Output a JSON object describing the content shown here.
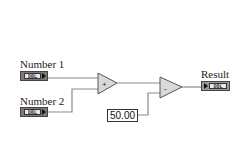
{
  "diagram": {
    "controls": [
      {
        "label": "Number 1",
        "type": "DBL"
      },
      {
        "label": "Number 2",
        "type": "DBL"
      }
    ],
    "functions": [
      {
        "name": "add",
        "symbol": "+"
      },
      {
        "name": "subtract",
        "symbol": "-"
      }
    ],
    "constant": {
      "value": "50.00"
    },
    "indicator": {
      "label": "Result",
      "type": "DBL"
    },
    "colors": {
      "wire": "#8a8a8a",
      "node_fill": "#d9d9d9",
      "terminal": "#7a7a7a"
    }
  }
}
